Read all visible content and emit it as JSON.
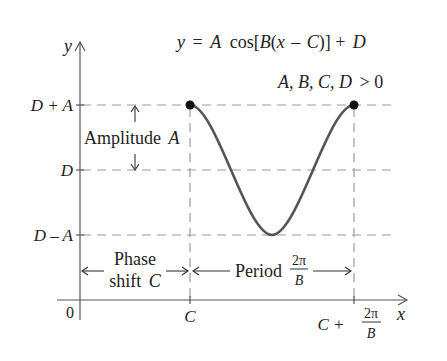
{
  "diagram": {
    "title_equation": {
      "y": "y",
      "eq": "=",
      "A": "A",
      "cos": "cos[",
      "B": "B",
      "open": "(",
      "x": "x",
      "minus": "–",
      "C": "C",
      "close": ")] +",
      "D": "D"
    },
    "conditions": {
      "vars": "A, B, C, D",
      "rel": "> 0"
    },
    "axes": {
      "y_label": "y",
      "x_label": "x",
      "origin_label": "0"
    },
    "y_ticks": [
      {
        "label": "D + A",
        "role": "maximum"
      },
      {
        "label": "D",
        "role": "midline"
      },
      {
        "label": "D – A",
        "role": "minimum"
      }
    ],
    "x_ticks": {
      "C": "C",
      "C_plus": "C +",
      "frac_num": "2π",
      "frac_den": "B"
    },
    "annotations": {
      "amplitude_word": "Amplitude",
      "amplitude_var": "A",
      "phase_line1": "Phase",
      "phase_line2_word": "shift",
      "phase_line2_var": "C",
      "period_word": "Period",
      "period_num": "2π",
      "period_den": "B"
    },
    "colors": {
      "curve": "#555555",
      "dashes": "#9a9a9a",
      "axes": "#555555",
      "points": "#111111",
      "text": "#222222"
    },
    "curve": {
      "type": "cosine",
      "domain": [
        "C",
        "C + 2π/B"
      ],
      "start_point": "(C, D + A)",
      "end_point": "(C + 2π/B, D + A)",
      "minimum_point": "(C + π/B, D – A)"
    }
  }
}
